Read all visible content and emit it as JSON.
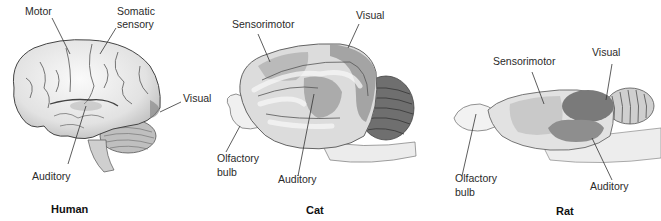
{
  "figure": {
    "panels": [
      {
        "species": "Human",
        "labels": {
          "motor": "Motor",
          "somatic_sensory_line1": "Somatic",
          "somatic_sensory_line2": "sensory",
          "visual": "Visual",
          "auditory": "Auditory"
        }
      },
      {
        "species": "Cat",
        "labels": {
          "sensorimotor": "Sensorimotor",
          "visual": "Visual",
          "olfactory_line1": "Olfactory",
          "olfactory_line2": "bulb",
          "auditory": "Auditory"
        }
      },
      {
        "species": "Rat",
        "labels": {
          "sensorimotor": "Sensorimotor",
          "visual": "Visual",
          "olfactory_line1": "Olfactory",
          "olfactory_line2": "bulb",
          "auditory": "Auditory"
        }
      }
    ],
    "colors": {
      "background": "#ffffff",
      "brain_light": "#ececec",
      "brain_mid": "#c9c9c9",
      "region_shade": "#a9a9a9",
      "region_dark": "#7d7d7d",
      "outline": "#555555",
      "leader_line": "#333333"
    }
  }
}
